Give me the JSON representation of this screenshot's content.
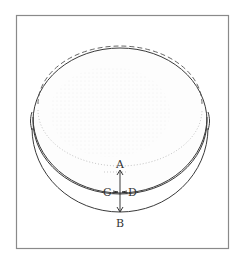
{
  "caption": {
    "text": "—————— ———— ————",
    "note": "top text line clipped, only letter bottoms visible"
  },
  "figure": {
    "labels": {
      "A": "A",
      "B": "B",
      "C": "C",
      "D": "D"
    },
    "colors": {
      "frame": "#8a8a8a",
      "stroke": "#3a3a3a",
      "shading": "#b8b8b8"
    }
  }
}
